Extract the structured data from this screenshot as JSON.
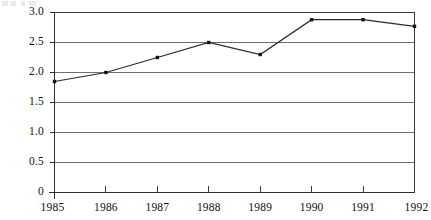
{
  "chart_data": {
    "type": "line",
    "title": "",
    "subtitle": "",
    "xlabel": "",
    "ylabel": "",
    "categories": [
      "1985",
      "1986",
      "1987",
      "1988",
      "1989",
      "1990",
      "1991",
      "1992"
    ],
    "x": [
      1985,
      1986,
      1987,
      1988,
      1989,
      1990,
      1991,
      1992
    ],
    "values": [
      1.85,
      2.0,
      2.25,
      2.5,
      2.3,
      2.88,
      2.88,
      2.77
    ],
    "series": [
      {
        "name": "",
        "values": [
          1.85,
          2.0,
          2.25,
          2.5,
          2.3,
          2.88,
          2.88,
          2.77
        ]
      }
    ],
    "xlim": [
      1985,
      1992
    ],
    "ylim": [
      0,
      3.0
    ],
    "ytick_labels": [
      "3.0",
      "2.5",
      "2.0",
      "1.5",
      "1.0",
      "0.5",
      "0"
    ],
    "ytick_values": [
      3.0,
      2.5,
      2.0,
      1.5,
      1.0,
      0.5,
      0
    ],
    "xtick_labels": [
      "1985",
      "1986",
      "1987",
      "1988",
      "1989",
      "1990",
      "1991",
      "1992"
    ],
    "grid": true,
    "grid_orientation": "horizontal",
    "legend": false,
    "legend_position": "none",
    "markers": true,
    "marker_shape": "square",
    "line_color": "#2b2b2b",
    "marker_color": "#111111",
    "grid_color": "#6f6f6f",
    "frame_color": "#3a3a3a",
    "background_color": "#ffffff"
  },
  "axes": {
    "y_labels": [
      {
        "text": "3.0",
        "value": 3.0
      },
      {
        "text": "2.5",
        "value": 2.5
      },
      {
        "text": "2.0",
        "value": 2.0
      },
      {
        "text": "1.5",
        "value": 1.5
      },
      {
        "text": "1.0",
        "value": 1.0
      },
      {
        "text": "0.5",
        "value": 0.5
      },
      {
        "text": "0",
        "value": 0
      }
    ],
    "x_labels": [
      {
        "text": "1985"
      },
      {
        "text": "1986"
      },
      {
        "text": "1987"
      },
      {
        "text": "1988"
      },
      {
        "text": "1989"
      },
      {
        "text": "1990"
      },
      {
        "text": "1991"
      },
      {
        "text": "1992"
      }
    ]
  }
}
